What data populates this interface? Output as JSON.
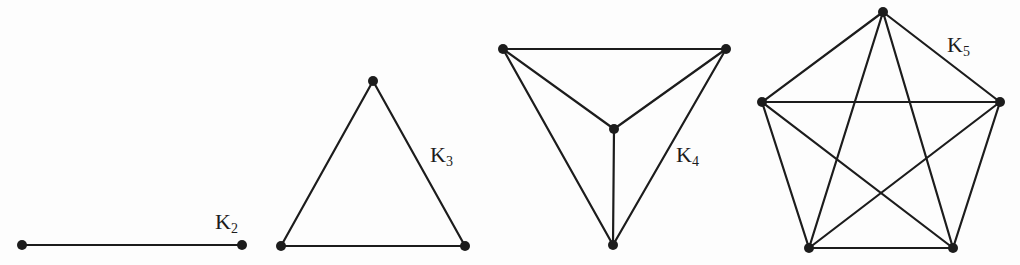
{
  "figure": {
    "colors": {
      "ink": "#1c1c1c",
      "background": "#fdfdfd"
    },
    "stroke_width": 2.2,
    "vertex_radius": 5
  },
  "graphs": [
    {
      "name": "K2",
      "label_base": "K",
      "label_sub": "2",
      "label_pos": {
        "x": 215,
        "y": 211
      },
      "vertices": [
        [
          22,
          245
        ],
        [
          242,
          245
        ]
      ],
      "edges": [
        [
          0,
          1
        ]
      ]
    },
    {
      "name": "K3",
      "label_base": "K",
      "label_sub": "3",
      "label_pos": {
        "x": 430,
        "y": 144
      },
      "vertices": [
        [
          373,
          81
        ],
        [
          281,
          246
        ],
        [
          465,
          246
        ]
      ],
      "edges": [
        [
          0,
          1
        ],
        [
          0,
          2
        ],
        [
          1,
          2
        ]
      ]
    },
    {
      "name": "K4",
      "label_base": "K",
      "label_sub": "4",
      "label_pos": {
        "x": 676,
        "y": 144
      },
      "vertices": [
        [
          503,
          49
        ],
        [
          726,
          49
        ],
        [
          614,
          129
        ],
        [
          613,
          245
        ]
      ],
      "edges": [
        [
          0,
          1
        ],
        [
          0,
          2
        ],
        [
          1,
          2
        ],
        [
          0,
          3
        ],
        [
          1,
          3
        ],
        [
          2,
          3
        ]
      ]
    },
    {
      "name": "K5",
      "label_base": "K",
      "label_sub": "5",
      "label_pos": {
        "x": 947,
        "y": 34
      },
      "vertices": [
        [
          883,
          12
        ],
        [
          762,
          102
        ],
        [
          1000,
          102
        ],
        [
          809,
          248
        ],
        [
          953,
          248
        ]
      ],
      "edges": [
        [
          0,
          1
        ],
        [
          0,
          2
        ],
        [
          0,
          3
        ],
        [
          0,
          4
        ],
        [
          1,
          2
        ],
        [
          1,
          3
        ],
        [
          1,
          4
        ],
        [
          2,
          3
        ],
        [
          2,
          4
        ],
        [
          3,
          4
        ]
      ]
    }
  ]
}
